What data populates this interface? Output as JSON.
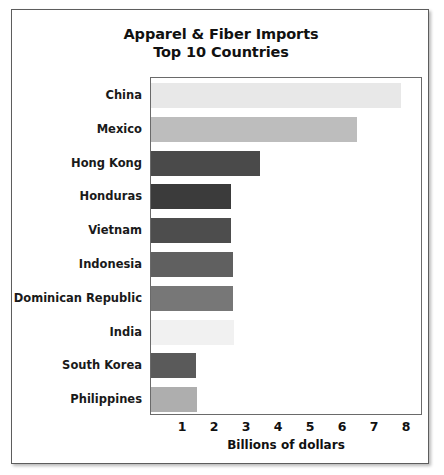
{
  "chart_data": {
    "type": "bar",
    "orientation": "horizontal",
    "title": "Apparel & Fiber Imports",
    "subtitle": "Top 10 Countries",
    "xlabel": "Billions of dollars",
    "ylabel": "",
    "xlim": [
      0,
      8.5
    ],
    "xticks": [
      1,
      2,
      3,
      4,
      5,
      6,
      7,
      8
    ],
    "grid": false,
    "legend": null,
    "categories": [
      "China",
      "Mexico",
      "Hong Kong",
      "Honduras",
      "Vietnam",
      "Indonesia",
      "Dominican Republic",
      "India",
      "South Korea",
      "Philippines"
    ],
    "values": [
      7.8,
      6.45,
      3.4,
      2.5,
      2.5,
      2.55,
      2.55,
      2.6,
      1.4,
      1.45
    ],
    "bar_colors": [
      "#e8e8e8",
      "#bdbdbd",
      "#4a4a4a",
      "#3b3b3b",
      "#4d4d4d",
      "#606060",
      "#777777",
      "#f1f1f1",
      "#5a5a5a",
      "#aeaeae"
    ]
  },
  "colors": {
    "frame_border": "#5d5d5d",
    "plot_border": "#6a6a6a",
    "text": "#111111",
    "background": "#ffffff"
  }
}
